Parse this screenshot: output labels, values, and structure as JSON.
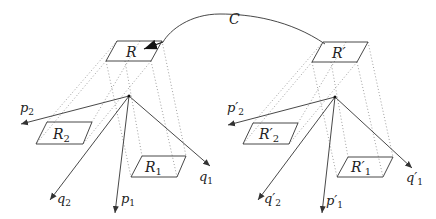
{
  "diagram": {
    "curve_label": "C",
    "left": {
      "top_region": "R",
      "region1": "R",
      "region1_sub": "1",
      "region2": "R",
      "region2_sub": "2",
      "p1": "p",
      "p1_sub": "1",
      "p2": "p",
      "p2_sub": "2",
      "q1": "q",
      "q1_sub": "1",
      "q2": "q",
      "q2_sub": "2"
    },
    "right": {
      "top_region": "R′",
      "region1": "R′",
      "region1_sub": "1",
      "region2": "R′",
      "region2_sub": "2",
      "p1": "p′",
      "p1_sub": "1",
      "p2": "p′",
      "p2_sub": "2",
      "q1": "q′",
      "q1_sub": "1",
      "q2": "q′",
      "q2_sub": "2"
    },
    "colors": {
      "line": "#333333",
      "dotted": "#888888"
    }
  }
}
